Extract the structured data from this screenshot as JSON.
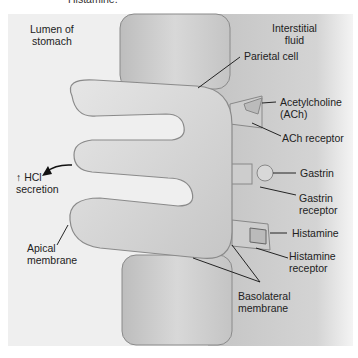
{
  "figure": {
    "top_cut_text": "Histamine.",
    "regions": {
      "lumen": "Lumen of\nstomach",
      "lumen_line1": "Lumen of",
      "lumen_line2": "stomach",
      "interstitial_line1": "Interstitial",
      "interstitial_line2": "fluid"
    },
    "labels": {
      "parietal_cell": "Parietal cell",
      "ach_line1": "Acetylcholine",
      "ach_line2": "(ACh)",
      "ach_receptor": "ACh receptor",
      "gastrin": "Gastrin",
      "gastrin_receptor_line1": "Gastrin",
      "gastrin_receptor_line2": "receptor",
      "histamine": "Histamine",
      "histamine_receptor_line1": "Histamine",
      "histamine_receptor_line2": "receptor",
      "basolateral_line1": "Basolateral",
      "basolateral_line2": "membrane",
      "apical_line1": "Apical",
      "apical_line2": "membrane",
      "hcl_line1": "↑ HCl",
      "hcl_line2": "secretion"
    },
    "colors": {
      "lumen_bg": "#efefef",
      "interstitial_bg": "#cfcfcf",
      "cell_fill": "#d6d6d6",
      "cell_stroke": "#8a8a8a",
      "line": "#111111"
    }
  }
}
